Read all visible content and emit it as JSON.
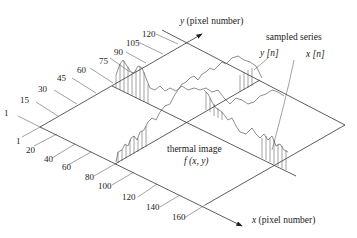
{
  "figure": {
    "x_axis_label_var": "x",
    "x_axis_label_unit": "(pixel number)",
    "y_axis_label_var": "y",
    "y_axis_label_unit": "(pixel number)",
    "plane_label": "thermal image",
    "plane_func": "f (x, y)",
    "series_title": "sampled series",
    "series_y": "y [n]",
    "series_x": "x [n]",
    "y_ticks": [
      "1",
      "15",
      "30",
      "45",
      "60",
      "75",
      "90",
      "105",
      "120"
    ],
    "x_ticks": [
      "1",
      "20",
      "40",
      "60",
      "80",
      "100",
      "120",
      "140",
      "160"
    ]
  }
}
